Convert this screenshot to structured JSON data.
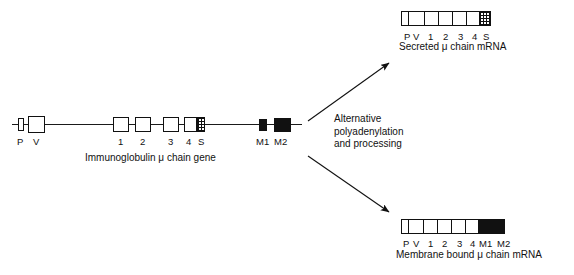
{
  "figure": {
    "background": "#ffffff",
    "ink_color": "#111111"
  },
  "gene": {
    "caption": "Immunoglobulin  μ chain gene",
    "exons": [
      {
        "label": "P",
        "style": "open",
        "x": 18,
        "y": 118,
        "w": 6,
        "h": 13
      },
      {
        "label": "V",
        "style": "open",
        "x": 28,
        "y": 116,
        "w": 17,
        "h": 17
      },
      {
        "label": "1",
        "style": "open",
        "x": 113,
        "y": 117,
        "w": 16,
        "h": 15
      },
      {
        "label": "2",
        "style": "open",
        "x": 135,
        "y": 117,
        "w": 16,
        "h": 15
      },
      {
        "label": "3",
        "style": "open",
        "x": 163,
        "y": 117,
        "w": 16,
        "h": 15
      },
      {
        "label": "4",
        "style": "open",
        "x": 184,
        "y": 117,
        "w": 13,
        "h": 15
      },
      {
        "label": "S",
        "style": "hatch",
        "x": 197,
        "y": 117,
        "w": 8,
        "h": 15
      },
      {
        "label": "M1",
        "style": "solid",
        "x": 259,
        "y": 119,
        "w": 8,
        "h": 12
      },
      {
        "label": "M2",
        "style": "solid",
        "x": 274,
        "y": 118,
        "w": 17,
        "h": 14
      }
    ],
    "labels": [
      {
        "text": "P",
        "x": 17,
        "y": 136
      },
      {
        "text": "V",
        "x": 33,
        "y": 136
      },
      {
        "text": "1",
        "x": 118,
        "y": 136
      },
      {
        "text": "2",
        "x": 140,
        "y": 136
      },
      {
        "text": "3",
        "x": 168,
        "y": 136
      },
      {
        "text": "4",
        "x": 186,
        "y": 136
      },
      {
        "text": "S",
        "x": 198,
        "y": 136
      },
      {
        "text": "M1",
        "x": 256,
        "y": 136
      },
      {
        "text": "M2",
        "x": 274,
        "y": 136
      }
    ]
  },
  "process": {
    "lines": [
      "Alternative",
      "polyadenylation",
      "and  processing"
    ]
  },
  "secreted_mrna": {
    "caption": "Secreted μ chain mRNA",
    "segments": [
      {
        "label": "P",
        "style": "open",
        "w": 7
      },
      {
        "label": "V",
        "style": "open",
        "w": 16
      },
      {
        "label": "1",
        "style": "open",
        "w": 14
      },
      {
        "label": "2",
        "style": "open",
        "w": 14
      },
      {
        "label": "3",
        "style": "open",
        "w": 14
      },
      {
        "label": "4",
        "style": "open",
        "w": 13
      },
      {
        "label": "S",
        "style": "hatch",
        "w": 10
      }
    ],
    "labels": [
      {
        "text": "P",
        "x": 404,
        "y": 31
      },
      {
        "text": "V",
        "x": 413,
        "y": 31
      },
      {
        "text": "1",
        "x": 428,
        "y": 31
      },
      {
        "text": "2",
        "x": 443,
        "y": 31
      },
      {
        "text": "3",
        "x": 458,
        "y": 31
      },
      {
        "text": "4",
        "x": 472,
        "y": 31
      },
      {
        "text": "S",
        "x": 483,
        "y": 31
      }
    ]
  },
  "membrane_mrna": {
    "caption": "Membrane bound  μ chain  mRNA",
    "segments": [
      {
        "label": "P",
        "style": "open",
        "w": 7
      },
      {
        "label": "V",
        "style": "open",
        "w": 15
      },
      {
        "label": "1",
        "style": "open",
        "w": 14
      },
      {
        "label": "2",
        "style": "open",
        "w": 14
      },
      {
        "label": "3",
        "style": "open",
        "w": 14
      },
      {
        "label": "4",
        "style": "open",
        "w": 13
      },
      {
        "label": "M1",
        "style": "solid",
        "w": 10
      },
      {
        "label": "M2",
        "style": "solid",
        "w": 15
      }
    ],
    "labels": [
      {
        "text": "P",
        "x": 403,
        "y": 238
      },
      {
        "text": "V",
        "x": 413,
        "y": 238
      },
      {
        "text": "1",
        "x": 428,
        "y": 238
      },
      {
        "text": "2",
        "x": 442,
        "y": 238
      },
      {
        "text": "3",
        "x": 457,
        "y": 238
      },
      {
        "text": "4",
        "x": 470,
        "y": 238
      },
      {
        "text": "M1",
        "x": 479,
        "y": 238
      },
      {
        "text": "M2",
        "x": 497,
        "y": 238
      }
    ]
  }
}
